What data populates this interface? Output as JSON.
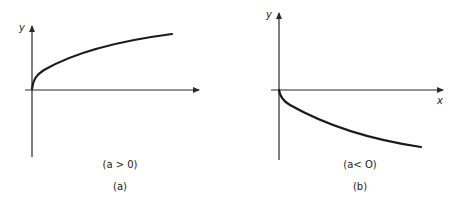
{
  "panels": [
    {
      "id": "a",
      "y_label": "y",
      "x_label": "",
      "condition": "(a > 0)",
      "caption": "(a)",
      "curve": "concave increasing curve from origin (y = sqrt-like, a > 0)"
    },
    {
      "id": "b",
      "y_label": "y",
      "x_label": "x",
      "condition": "(a< O)",
      "caption": "(b)",
      "curve": "convex decreasing curve from origin below x-axis (a < 0)"
    }
  ],
  "colors": {
    "ink": "#1a1a1a",
    "background": "#ffffff"
  }
}
